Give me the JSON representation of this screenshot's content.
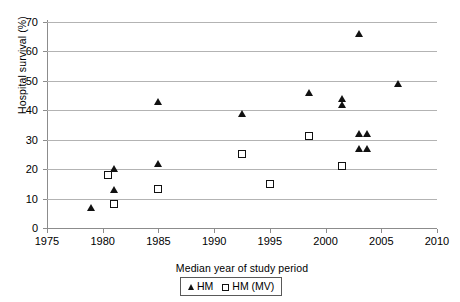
{
  "chart_data": {
    "type": "scatter",
    "title": "",
    "xlabel": "Median year of study period",
    "ylabel": "Hospital survival (%)",
    "xlim": [
      1975,
      2010
    ],
    "ylim": [
      0,
      70
    ],
    "xticks": [
      1975,
      1980,
      1985,
      1990,
      1995,
      2000,
      2005,
      2010
    ],
    "yticks": [
      0,
      10,
      20,
      30,
      40,
      50,
      60,
      70
    ],
    "xtick_labels": [
      "1975",
      "1980",
      "1985",
      "1990",
      "1995",
      "2000",
      "2005",
      "2010"
    ],
    "ytick_labels": [
      "0",
      "10",
      "20",
      "30",
      "40",
      "50",
      "60",
      "70"
    ],
    "grid": "horizontal",
    "legend_position": "bottom-center",
    "series": [
      {
        "name": "HM",
        "marker": "filled-triangle",
        "color": "#111111",
        "points": [
          {
            "x": 1979.0,
            "y": 7
          },
          {
            "x": 1981.0,
            "y": 20
          },
          {
            "x": 1981.0,
            "y": 13
          },
          {
            "x": 1985.0,
            "y": 43
          },
          {
            "x": 1985.0,
            "y": 22
          },
          {
            "x": 1992.5,
            "y": 39
          },
          {
            "x": 1998.5,
            "y": 46
          },
          {
            "x": 2001.5,
            "y": 44
          },
          {
            "x": 2001.5,
            "y": 42
          },
          {
            "x": 2003.0,
            "y": 66
          },
          {
            "x": 2003.0,
            "y": 32
          },
          {
            "x": 2003.7,
            "y": 32
          },
          {
            "x": 2003.0,
            "y": 27
          },
          {
            "x": 2003.7,
            "y": 27
          },
          {
            "x": 2006.5,
            "y": 49
          }
        ]
      },
      {
        "name": "HM (MV)",
        "marker": "open-square",
        "color": "#111111",
        "points": [
          {
            "x": 1980.5,
            "y": 18
          },
          {
            "x": 1981.0,
            "y": 8
          },
          {
            "x": 1985.0,
            "y": 13
          },
          {
            "x": 1992.5,
            "y": 25
          },
          {
            "x": 1995.0,
            "y": 15
          },
          {
            "x": 1998.5,
            "y": 31
          },
          {
            "x": 2001.5,
            "y": 21
          }
        ]
      }
    ]
  },
  "legend": {
    "entries": [
      {
        "label": "HM",
        "marker": "filled-triangle"
      },
      {
        "label": "HM (MV)",
        "marker": "open-square"
      }
    ]
  },
  "colors": {
    "marker": "#111111",
    "gridline": "#b3b3b3",
    "axis": "#8c8c8c",
    "background": "#ffffff"
  }
}
